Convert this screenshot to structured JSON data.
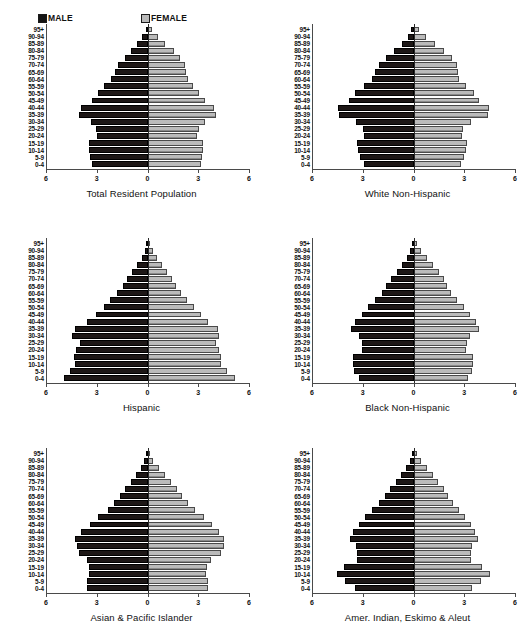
{
  "legend": {
    "male_label": "MALE",
    "female_label": "FEMALE",
    "male_color": "#141414",
    "female_color": "#b9b9b9"
  },
  "axis": {
    "tick_labels": [
      "6",
      "3",
      "0",
      "3",
      "6"
    ],
    "min": -6,
    "max": 6
  },
  "age_groups": [
    "95+",
    "90-94",
    "85-89",
    "80-84",
    "75-79",
    "70-74",
    "65-69",
    "60-64",
    "55-59",
    "50-54",
    "45-49",
    "40-44",
    "35-39",
    "30-34",
    "25-29",
    "20-24",
    "15-19",
    "10-14",
    "5-9",
    "0-4"
  ],
  "chart_data": [
    {
      "type": "bar",
      "title": "Total Resident Population",
      "xlabel": "",
      "ylabel": "",
      "xlim": [
        -6,
        6
      ],
      "grid": false,
      "legend_position": "top",
      "categories": [
        "95+",
        "90-94",
        "85-89",
        "80-84",
        "75-79",
        "70-74",
        "65-69",
        "60-64",
        "55-59",
        "50-54",
        "45-49",
        "40-44",
        "35-39",
        "30-34",
        "25-29",
        "20-24",
        "15-19",
        "10-14",
        "5-9",
        "0-4"
      ],
      "series": [
        {
          "name": "MALE",
          "values": [
            0.1,
            0.3,
            0.6,
            1.0,
            1.35,
            1.75,
            1.95,
            2.15,
            2.55,
            2.95,
            3.3,
            3.95,
            4.05,
            3.35,
            3.05,
            3.0,
            3.45,
            3.45,
            3.4,
            3.3
          ]
        },
        {
          "name": "FEMALE",
          "values": [
            0.25,
            0.6,
            1.05,
            1.55,
            1.9,
            2.2,
            2.3,
            2.4,
            2.7,
            3.05,
            3.4,
            3.95,
            4.05,
            3.4,
            3.05,
            2.95,
            3.3,
            3.3,
            3.25,
            3.15
          ]
        }
      ]
    },
    {
      "type": "bar",
      "title": "White Non-Hispanic",
      "xlabel": "",
      "ylabel": "",
      "xlim": [
        -6,
        6
      ],
      "grid": false,
      "legend_position": "top",
      "categories": [
        "95+",
        "90-94",
        "85-89",
        "80-84",
        "75-79",
        "70-74",
        "65-69",
        "60-64",
        "55-59",
        "50-54",
        "45-49",
        "40-44",
        "35-39",
        "30-34",
        "25-29",
        "20-24",
        "15-19",
        "10-14",
        "5-9",
        "0-4"
      ],
      "series": [
        {
          "name": "MALE",
          "values": [
            0.12,
            0.35,
            0.7,
            1.15,
            1.6,
            2.05,
            2.25,
            2.45,
            2.95,
            3.45,
            3.8,
            4.45,
            4.4,
            3.4,
            3.0,
            2.95,
            3.35,
            3.3,
            3.15,
            2.9
          ]
        },
        {
          "name": "FEMALE",
          "values": [
            0.3,
            0.75,
            1.25,
            1.8,
            2.25,
            2.6,
            2.65,
            2.7,
            3.1,
            3.55,
            3.9,
            4.45,
            4.4,
            3.4,
            2.95,
            2.85,
            3.15,
            3.1,
            3.0,
            2.8
          ]
        }
      ]
    },
    {
      "type": "bar",
      "title": "Hispanic",
      "xlabel": "",
      "ylabel": "",
      "xlim": [
        -6,
        6
      ],
      "grid": false,
      "legend_position": "top",
      "categories": [
        "95+",
        "90-94",
        "85-89",
        "80-84",
        "75-79",
        "70-74",
        "65-69",
        "60-64",
        "55-59",
        "50-54",
        "45-49",
        "40-44",
        "35-39",
        "30-34",
        "25-29",
        "20-24",
        "15-19",
        "10-14",
        "5-9",
        "0-4"
      ],
      "series": [
        {
          "name": "MALE",
          "values": [
            0.05,
            0.15,
            0.35,
            0.6,
            0.9,
            1.2,
            1.45,
            1.8,
            2.2,
            2.6,
            3.05,
            3.55,
            4.3,
            4.45,
            4.0,
            4.2,
            4.35,
            4.3,
            4.6,
            4.95
          ]
        },
        {
          "name": "FEMALE",
          "values": [
            0.12,
            0.3,
            0.55,
            0.85,
            1.15,
            1.45,
            1.7,
            2.0,
            2.35,
            2.75,
            3.15,
            3.6,
            4.15,
            4.25,
            4.05,
            4.25,
            4.35,
            4.35,
            4.7,
            5.15
          ]
        }
      ]
    },
    {
      "type": "bar",
      "title": "Black Non-Hispanic",
      "xlabel": "",
      "ylabel": "",
      "xlim": [
        -6,
        6
      ],
      "grid": false,
      "legend_position": "top",
      "categories": [
        "95+",
        "90-94",
        "85-89",
        "80-84",
        "75-79",
        "70-74",
        "65-69",
        "60-64",
        "55-59",
        "50-54",
        "45-49",
        "40-44",
        "35-39",
        "30-34",
        "25-29",
        "20-24",
        "15-19",
        "10-14",
        "5-9",
        "0-4"
      ],
      "series": [
        {
          "name": "MALE",
          "values": [
            0.08,
            0.2,
            0.4,
            0.7,
            1.0,
            1.35,
            1.6,
            1.85,
            2.25,
            2.7,
            3.05,
            3.45,
            3.7,
            3.2,
            3.05,
            3.05,
            3.55,
            3.55,
            3.5,
            3.2
          ]
        },
        {
          "name": "FEMALE",
          "values": [
            0.18,
            0.45,
            0.8,
            1.15,
            1.5,
            1.8,
            2.0,
            2.2,
            2.6,
            3.0,
            3.35,
            3.7,
            3.9,
            3.35,
            3.15,
            3.1,
            3.5,
            3.5,
            3.45,
            3.2
          ]
        }
      ]
    },
    {
      "type": "bar",
      "title": "Asian & Pacific Islander",
      "xlabel": "",
      "ylabel": "",
      "xlim": [
        -6,
        6
      ],
      "grid": false,
      "legend_position": "top",
      "categories": [
        "95+",
        "90-94",
        "85-89",
        "80-84",
        "75-79",
        "70-74",
        "65-69",
        "60-64",
        "55-59",
        "50-54",
        "45-49",
        "40-44",
        "35-39",
        "30-34",
        "25-29",
        "20-24",
        "15-19",
        "10-14",
        "5-9",
        "0-4"
      ],
      "series": [
        {
          "name": "MALE",
          "values": [
            0.06,
            0.18,
            0.4,
            0.7,
            1.0,
            1.35,
            1.65,
            2.0,
            2.35,
            2.95,
            3.4,
            3.95,
            4.3,
            4.15,
            4.05,
            3.6,
            3.45,
            3.45,
            3.55,
            3.55
          ]
        },
        {
          "name": "FEMALE",
          "values": [
            0.15,
            0.35,
            0.7,
            1.05,
            1.4,
            1.75,
            2.05,
            2.4,
            2.8,
            3.35,
            3.8,
            4.25,
            4.5,
            4.55,
            4.35,
            3.75,
            3.5,
            3.45,
            3.55,
            3.55
          ]
        }
      ]
    },
    {
      "type": "bar",
      "title": "Amer. Indian, Eskimo & Aleut",
      "xlabel": "",
      "ylabel": "",
      "xlim": [
        -6,
        6
      ],
      "grid": false,
      "legend_position": "top",
      "categories": [
        "95+",
        "90-94",
        "85-89",
        "80-84",
        "75-79",
        "70-74",
        "65-69",
        "60-64",
        "55-59",
        "50-54",
        "45-49",
        "40-44",
        "35-39",
        "30-34",
        "25-29",
        "20-24",
        "15-19",
        "10-14",
        "5-9",
        "0-4"
      ],
      "series": [
        {
          "name": "MALE",
          "values": [
            0.08,
            0.22,
            0.45,
            0.75,
            1.05,
            1.4,
            1.7,
            2.05,
            2.45,
            2.85,
            3.25,
            3.55,
            3.75,
            3.4,
            3.35,
            3.35,
            4.1,
            4.55,
            4.05,
            3.45
          ]
        },
        {
          "name": "FEMALE",
          "values": [
            0.18,
            0.45,
            0.8,
            1.15,
            1.45,
            1.8,
            2.05,
            2.35,
            2.7,
            3.05,
            3.4,
            3.65,
            3.8,
            3.45,
            3.4,
            3.4,
            4.05,
            4.5,
            4.0,
            3.45
          ]
        }
      ]
    }
  ]
}
